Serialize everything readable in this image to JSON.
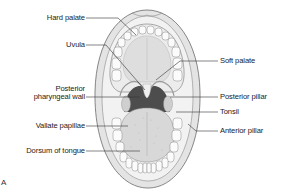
{
  "figure": {
    "letter": "A"
  },
  "labels_left": [
    {
      "id": "hard-palate",
      "text": "Hard palate",
      "x": 29,
      "y": 14,
      "w": 56,
      "line": [
        86,
        18,
        118,
        18,
        136,
        35
      ]
    },
    {
      "id": "uvula",
      "text": "Uvula",
      "x": 62,
      "y": 41,
      "w": 23,
      "line": [
        86,
        45,
        106,
        45,
        145,
        90
      ]
    },
    {
      "id": "posterior-pharyngeal-wall-1",
      "text": "Posterior",
      "x": 49,
      "y": 85,
      "w": 36
    },
    {
      "id": "posterior-pharyngeal-wall-2",
      "text": "pharyngeal wall",
      "x": 25,
      "y": 93,
      "w": 60,
      "line": [
        86,
        97,
        140,
        97
      ]
    },
    {
      "id": "vallate-papillae",
      "text": "Vallate papillae",
      "x": 27,
      "y": 122,
      "w": 58,
      "line": [
        86,
        126,
        128,
        126
      ]
    },
    {
      "id": "dorsum-of-tongue",
      "text": "Dorsum of tongue",
      "x": 14,
      "y": 147,
      "w": 71,
      "line": [
        86,
        151,
        140,
        151
      ]
    }
  ],
  "labels_right": [
    {
      "id": "soft-palate",
      "text": "Soft palate",
      "x": 220,
      "y": 57,
      "line": [
        218,
        61,
        180,
        61,
        156,
        80
      ]
    },
    {
      "id": "posterior-pillar",
      "text": "Posterior pillar",
      "x": 220,
      "y": 93,
      "line": [
        218,
        97,
        170,
        97
      ]
    },
    {
      "id": "tonsil",
      "text": "Tonsil",
      "x": 220,
      "y": 108,
      "line": [
        218,
        112,
        176,
        112
      ]
    },
    {
      "id": "anterior-pillar",
      "text": "Anterior pillar",
      "x": 220,
      "y": 127,
      "line": [
        218,
        131,
        196,
        131,
        188,
        124
      ]
    }
  ],
  "colors": {
    "lip": "#e6e6e6",
    "lip_stroke": "#6a6a6a",
    "gum": "#efefef",
    "palate": "#dcdcdc",
    "teeth": "#fafafa",
    "throat_dark": "#4a4a4a",
    "tongue": "#d8d8d8",
    "leader": "#333333",
    "text": "#222222"
  }
}
